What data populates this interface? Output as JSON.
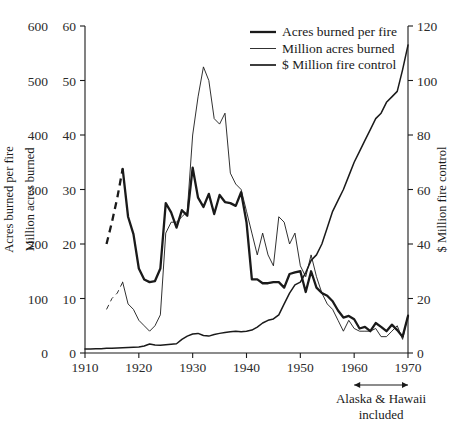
{
  "chart_data": {
    "type": "line",
    "title": "",
    "xlabel": "",
    "xlim": [
      1910,
      1970
    ],
    "x_ticks": [
      "1910",
      "1920",
      "1930",
      "1940",
      "1950",
      "1960",
      "1970"
    ],
    "grid": false,
    "legend_position": "top-center",
    "axes": {
      "left_outer": {
        "label": "Acres burned per fire",
        "ticks": [
          "0",
          "100",
          "200",
          "300",
          "400",
          "500",
          "600"
        ],
        "lim": [
          0,
          600
        ]
      },
      "left_inner": {
        "label": "Million acres burned",
        "ticks": [
          "0",
          "10",
          "20",
          "30",
          "40",
          "50",
          "60"
        ],
        "lim": [
          0,
          60
        ]
      },
      "right": {
        "label": "$ Million fire control",
        "ticks": [
          "0",
          "20",
          "40",
          "60",
          "80",
          "100",
          "120"
        ],
        "lim": [
          0,
          120
        ]
      }
    },
    "annotations": [
      {
        "name": "alaska-hawaii-note",
        "text_line1": "Alaska & Hawaii",
        "text_line2": "included",
        "arrow_from_year": 1960,
        "arrow_to_year": 1970
      }
    ],
    "series": [
      {
        "name": "Acres burned per fire",
        "axis": "left_outer",
        "style": "thick",
        "x": [
          1914,
          1915,
          1916,
          1917,
          1918,
          1919,
          1920,
          1921,
          1922,
          1923,
          1924,
          1925,
          1926,
          1927,
          1928,
          1929,
          1930,
          1931,
          1932,
          1933,
          1934,
          1935,
          1936,
          1937,
          1938,
          1939,
          1940,
          1941,
          1942,
          1943,
          1944,
          1945,
          1946,
          1947,
          1948,
          1949,
          1950,
          1951,
          1952,
          1953,
          1954,
          1955,
          1956,
          1957,
          1958,
          1959,
          1960,
          1961,
          1962,
          1963,
          1964,
          1965,
          1966,
          1967,
          1968,
          1969,
          1970
        ],
        "y": [
          200,
          240,
          285,
          338,
          250,
          218,
          155,
          135,
          130,
          132,
          155,
          275,
          258,
          230,
          262,
          252,
          340,
          285,
          268,
          292,
          255,
          290,
          277,
          275,
          270,
          295,
          240,
          135,
          135,
          128,
          128,
          130,
          130,
          120,
          145,
          148,
          150,
          112,
          150,
          120,
          110,
          105,
          95,
          78,
          65,
          68,
          62,
          45,
          48,
          40,
          55,
          48,
          40,
          52,
          42,
          30,
          68
        ],
        "dashed_from": 1914,
        "dashed_to": 1917,
        "units": "acres per fire"
      },
      {
        "name": "Million acres burned",
        "axis": "left_inner",
        "style": "thin",
        "x": [
          1914,
          1915,
          1916,
          1917,
          1918,
          1919,
          1920,
          1921,
          1922,
          1923,
          1924,
          1925,
          1926,
          1927,
          1928,
          1929,
          1930,
          1931,
          1932,
          1933,
          1934,
          1935,
          1936,
          1937,
          1938,
          1939,
          1940,
          1941,
          1942,
          1943,
          1944,
          1945,
          1946,
          1947,
          1948,
          1949,
          1950,
          1951,
          1952,
          1953,
          1954,
          1955,
          1956,
          1957,
          1958,
          1959,
          1960,
          1961,
          1962,
          1963,
          1964,
          1965,
          1966,
          1967,
          1968,
          1969,
          1970
        ],
        "y": [
          8,
          10,
          11,
          13,
          9,
          8,
          6,
          5,
          4,
          5,
          7,
          22,
          24,
          24,
          25,
          26,
          40,
          47,
          52.5,
          50,
          43,
          42,
          44,
          33,
          31,
          30,
          26,
          22,
          18,
          22,
          18,
          16,
          25,
          24,
          20,
          22,
          16,
          14,
          18,
          14,
          11,
          9,
          8,
          6,
          4,
          6,
          4.5,
          4,
          4,
          4,
          4.5,
          3,
          3,
          4,
          5,
          2.5,
          7
        ],
        "dashed_from": 1914,
        "dashed_to": 1917,
        "units": "million acres"
      },
      {
        "name": "$ Million fire control",
        "axis": "right",
        "style": "medium",
        "x": [
          1910,
          1911,
          1912,
          1913,
          1914,
          1915,
          1916,
          1917,
          1918,
          1919,
          1920,
          1921,
          1922,
          1923,
          1924,
          1925,
          1926,
          1927,
          1928,
          1929,
          1930,
          1931,
          1932,
          1933,
          1934,
          1935,
          1936,
          1937,
          1938,
          1939,
          1940,
          1941,
          1942,
          1943,
          1944,
          1945,
          1946,
          1947,
          1948,
          1949,
          1950,
          1951,
          1952,
          1953,
          1954,
          1955,
          1956,
          1957,
          1958,
          1959,
          1960,
          1961,
          1962,
          1963,
          1964,
          1965,
          1966,
          1967,
          1968,
          1969,
          1970
        ],
        "y": [
          1.5,
          1.5,
          1.6,
          1.6,
          1.7,
          1.7,
          1.8,
          1.9,
          2.0,
          2.1,
          2.2,
          2.6,
          3.3,
          2.9,
          2.8,
          3.0,
          3.2,
          3.4,
          5.0,
          6.2,
          7.0,
          7.2,
          6.4,
          6.2,
          6.8,
          7.2,
          7.5,
          7.8,
          8.0,
          7.8,
          8.0,
          8.4,
          9.5,
          11.0,
          12.0,
          12.5,
          14.0,
          18.0,
          22.0,
          25.0,
          26.0,
          29.5,
          34.0,
          36.0,
          40.0,
          46.0,
          52.0,
          56.0,
          60.0,
          65.0,
          70.0,
          74.0,
          78.0,
          82.0,
          86.0,
          88.0,
          92.0,
          94.0,
          96.0,
          104.0,
          113.0
        ],
        "units": "$ million"
      }
    ]
  },
  "legend": {
    "entries": [
      {
        "label": "Acres burned per fire"
      },
      {
        "label": "Million acres burned"
      },
      {
        "label": "$ Million fire control"
      }
    ]
  },
  "colors": {
    "ink": "#1a1a1a",
    "line": "#222222",
    "background": "#ffffff"
  }
}
